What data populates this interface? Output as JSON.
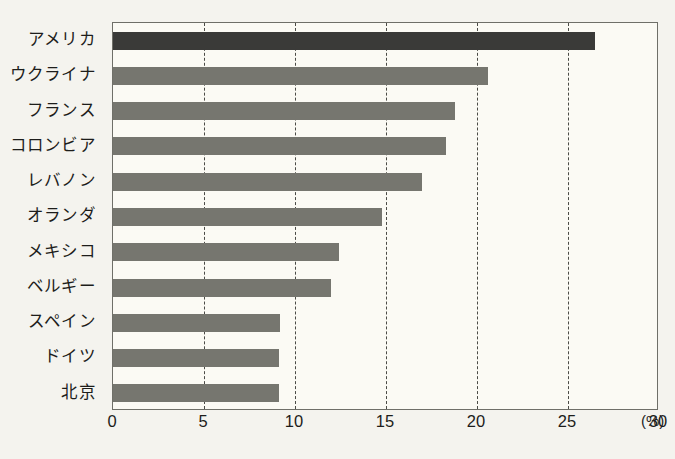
{
  "chart_data": {
    "type": "bar",
    "orientation": "horizontal",
    "title": "",
    "subtitle": "",
    "xlabel": "(%)",
    "ylabel": "",
    "categories": [
      "アメリカ",
      "ウクライナ",
      "フランス",
      "コロンビア",
      "レバノン",
      "オランダ",
      "メキシコ",
      "ベルギー",
      "スペイン",
      "ドイツ",
      "北京"
    ],
    "values": [
      26.5,
      20.6,
      18.8,
      18.3,
      17.0,
      14.8,
      12.4,
      12.0,
      9.2,
      9.1,
      9.1
    ],
    "xlim": [
      0,
      30
    ],
    "xticks": [
      0,
      5,
      10,
      15,
      20,
      25,
      30
    ],
    "xtick_labels": [
      "0",
      "5",
      "10",
      "15",
      "20",
      "25",
      "30"
    ],
    "unit_label": "(%)",
    "grid": "vertical-dashed",
    "legend": "none",
    "bar_color": "#76766f",
    "highlight_color": "#3a3a38",
    "highlight_index": 0,
    "plot_background": "#fbfaf4",
    "page_background": "#f4f3ee",
    "axis_color": "#6f6f68"
  }
}
